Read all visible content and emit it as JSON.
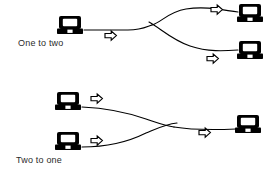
{
  "figure": {
    "background_color": "#ffffff",
    "stroke_color": "#000000",
    "text_color": "#2b2b2b"
  },
  "panels": [
    {
      "id": "one-to-two",
      "caption": "One to two",
      "caption_position": {
        "x": 18,
        "y": 38
      },
      "description": "A single source computer whose link splits into two branches that each terminate at a destination computer.",
      "nodes": [
        {
          "role": "source",
          "icon": "computer-icon",
          "x": 70,
          "y": 25
        },
        {
          "role": "destination",
          "icon": "computer-icon",
          "x": 250,
          "y": 13
        },
        {
          "role": "destination",
          "icon": "computer-icon",
          "x": 250,
          "y": 50
        }
      ],
      "links": [
        {
          "from": "source",
          "to": "split",
          "path": "M 84 30 L 128 30 C 142 30 146 27 152 25"
        },
        {
          "from": "split",
          "to": "destination-top",
          "path": "M 152 25 C 162 22 168 12 186 9 C 206 6 222 10 238 12"
        },
        {
          "from": "split",
          "to": "destination-bottom",
          "path": "M 149 22 C 160 28 172 40 190 46 C 208 52 224 51 238 50"
        }
      ],
      "flow_arrows": [
        {
          "icon": "flow-arrow-right-icon",
          "x": 110,
          "y": 35,
          "direction": "right"
        },
        {
          "icon": "flow-arrow-right-icon",
          "x": 216,
          "y": 10,
          "direction": "right"
        },
        {
          "icon": "flow-arrow-right-icon",
          "x": 212,
          "y": 58,
          "direction": "right"
        }
      ]
    },
    {
      "id": "two-to-one",
      "caption": "Two to one",
      "caption_position": {
        "x": 16,
        "y": 155
      },
      "description": "Two source computers whose links merge into a single branch that terminates at one destination computer.",
      "nodes": [
        {
          "role": "source",
          "icon": "computer-icon",
          "x": 68,
          "y": 101
        },
        {
          "role": "source",
          "icon": "computer-icon",
          "x": 68,
          "y": 141
        },
        {
          "role": "destination",
          "icon": "computer-icon",
          "x": 248,
          "y": 124
        }
      ],
      "links": [
        {
          "from": "source-top",
          "to": "merge",
          "path": "M 82 107 C 104 108 126 112 146 119 C 158 123 166 126 174 127"
        },
        {
          "from": "source-bottom",
          "to": "merge",
          "path": "M 82 147 C 106 147 128 142 146 133 C 158 128 166 124 177 123"
        },
        {
          "from": "merge",
          "to": "destination",
          "path": "M 174 127 C 192 130 212 130 236 129"
        }
      ],
      "flow_arrows": [
        {
          "icon": "flow-arrow-right-icon",
          "x": 96,
          "y": 98,
          "direction": "right"
        },
        {
          "icon": "flow-arrow-right-icon",
          "x": 96,
          "y": 140,
          "direction": "right"
        },
        {
          "icon": "flow-arrow-right-icon",
          "x": 204,
          "y": 132,
          "direction": "right"
        }
      ]
    }
  ]
}
